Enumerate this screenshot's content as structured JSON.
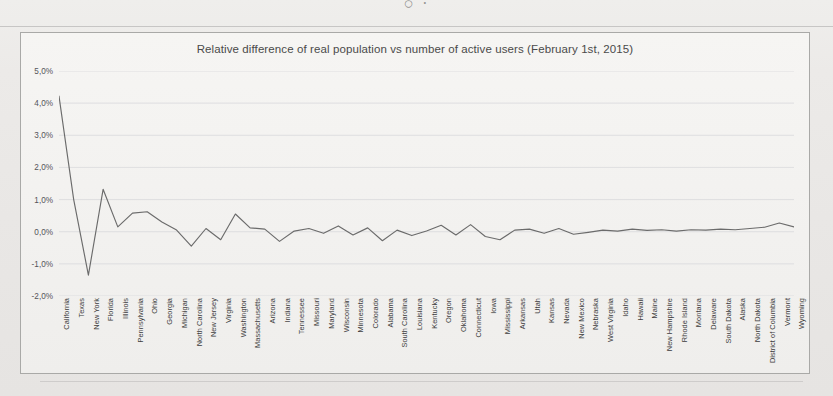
{
  "page": {
    "top_ghost_text": "○                                                                                          ·"
  },
  "chart": {
    "title": "Relative difference of real population vs number of active users (February 1st, 2015)",
    "y_tick_labels": [
      "5,0%",
      "4,0%",
      "3,0%",
      "2,0%",
      "1,0%",
      "0,0%",
      "-1,0%",
      "-2,0%"
    ],
    "line_color": "#6b6b6b",
    "grid_color": "#d9d9dc",
    "frame_color": "#a9a9a7"
  },
  "chart_data": {
    "type": "line",
    "title": "Relative difference of real population vs number of active users (February 1st, 2015)",
    "xlabel": "",
    "ylabel": "",
    "ylim": [
      -2.0,
      5.0
    ],
    "ytick_values": [
      5.0,
      4.0,
      3.0,
      2.0,
      1.0,
      0.0,
      -1.0,
      -2.0
    ],
    "ytick_labels": [
      "5,0%",
      "4,0%",
      "3,0%",
      "2,0%",
      "1,0%",
      "0,0%",
      "-1,0%",
      "-2,0%"
    ],
    "grid": true,
    "legend": false,
    "units": "percent",
    "decimal_separator": ",",
    "categories": [
      "California",
      "Texas",
      "New York",
      "Florida",
      "Illinois",
      "Pennsylvania",
      "Ohio",
      "Georgia",
      "Michigan",
      "North Carolina",
      "New Jersey",
      "Virginia",
      "Washington",
      "Massachusetts",
      "Arizona",
      "Indiana",
      "Tennessee",
      "Missouri",
      "Maryland",
      "Wisconsin",
      "Minnesota",
      "Colorado",
      "Alabama",
      "South Carolina",
      "Louisiana",
      "Kentucky",
      "Oregon",
      "Oklahoma",
      "Connecticut",
      "Iowa",
      "Mississippi",
      "Arkansas",
      "Utah",
      "Kansas",
      "Nevada",
      "New Mexico",
      "Nebraska",
      "West Virginia",
      "Idaho",
      "Hawaii",
      "Maine",
      "New Hampshire",
      "Rhode Island",
      "Montana",
      "Delaware",
      "South Dakota",
      "Alaska",
      "North Dakota",
      "District of Columbia",
      "Vermont",
      "Wyoming"
    ],
    "values": [
      4.22,
      1.0,
      -1.35,
      1.32,
      0.15,
      0.58,
      0.62,
      0.3,
      0.05,
      -0.45,
      0.1,
      -0.25,
      0.55,
      0.12,
      0.08,
      -0.3,
      0.02,
      0.1,
      -0.05,
      0.18,
      -0.1,
      0.12,
      -0.28,
      0.05,
      -0.12,
      0.02,
      0.2,
      -0.1,
      0.22,
      -0.15,
      -0.25,
      0.05,
      0.08,
      -0.05,
      0.1,
      -0.08,
      -0.02,
      0.05,
      0.02,
      0.08,
      0.04,
      0.06,
      0.02,
      0.06,
      0.05,
      0.08,
      0.06,
      0.1,
      0.14,
      0.27,
      0.15
    ],
    "series": [
      {
        "name": "Relative difference",
        "values": [
          4.22,
          1.0,
          -1.35,
          1.32,
          0.15,
          0.58,
          0.62,
          0.3,
          0.05,
          -0.45,
          0.1,
          -0.25,
          0.55,
          0.12,
          0.08,
          -0.3,
          0.02,
          0.1,
          -0.05,
          0.18,
          -0.1,
          0.12,
          -0.28,
          0.05,
          -0.12,
          0.02,
          0.2,
          -0.1,
          0.22,
          -0.15,
          -0.25,
          0.05,
          0.08,
          -0.05,
          0.1,
          -0.08,
          -0.02,
          0.05,
          0.02,
          0.08,
          0.04,
          0.06,
          0.02,
          0.06,
          0.05,
          0.08,
          0.06,
          0.1,
          0.14,
          0.27,
          0.15
        ]
      }
    ]
  }
}
